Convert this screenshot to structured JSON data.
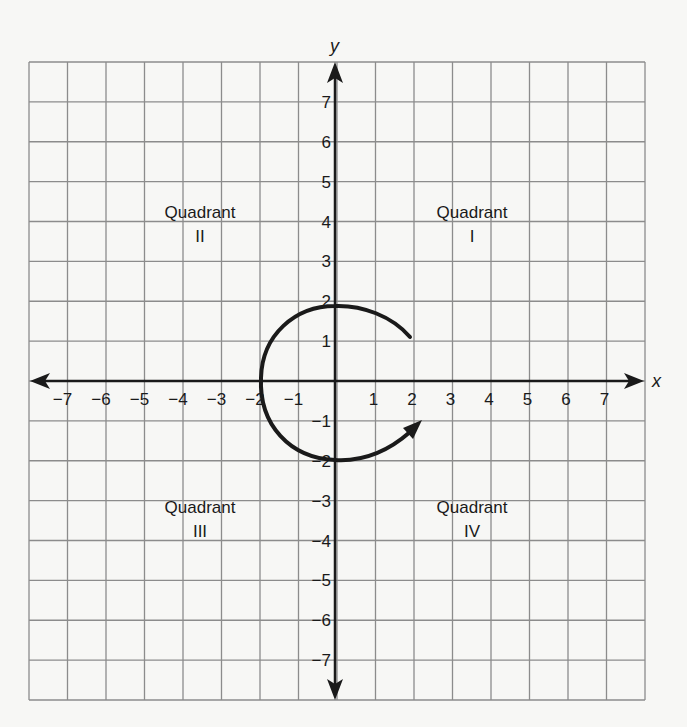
{
  "diagram": {
    "type": "coordinate-plane",
    "axes": {
      "x_label": "x",
      "y_label": "y",
      "x_ticks": [
        "−7",
        "−6",
        "−5",
        "−4",
        "−3",
        "−2",
        "−1",
        "1",
        "2",
        "3",
        "4",
        "5",
        "6",
        "7"
      ],
      "y_ticks": [
        "7",
        "6",
        "5",
        "4",
        "3",
        "2",
        "1",
        "−1",
        "−2",
        "−3",
        "−4",
        "−5",
        "−6",
        "−7"
      ]
    },
    "quadrants": [
      {
        "id": "I",
        "label": "Quadrant",
        "numeral": "I"
      },
      {
        "id": "II",
        "label": "Quadrant",
        "numeral": "II"
      },
      {
        "id": "III",
        "label": "Quadrant",
        "numeral": "III"
      },
      {
        "id": "IV",
        "label": "Quadrant",
        "numeral": "IV"
      }
    ],
    "rotation_arrow": {
      "direction": "counterclockwise",
      "start_point": [
        2,
        1
      ],
      "end_point": [
        2.2,
        -1.5
      ],
      "description": "Curved arrow circling the origin counterclockwise from Quadrant I through II and III into IV"
    },
    "grid": {
      "x_range": [
        -8,
        8
      ],
      "y_range": [
        -8,
        8
      ]
    },
    "colors": {
      "grid": "#8c8c8c",
      "axis": "#1a1a1a",
      "background": "#f7f7f5"
    }
  }
}
